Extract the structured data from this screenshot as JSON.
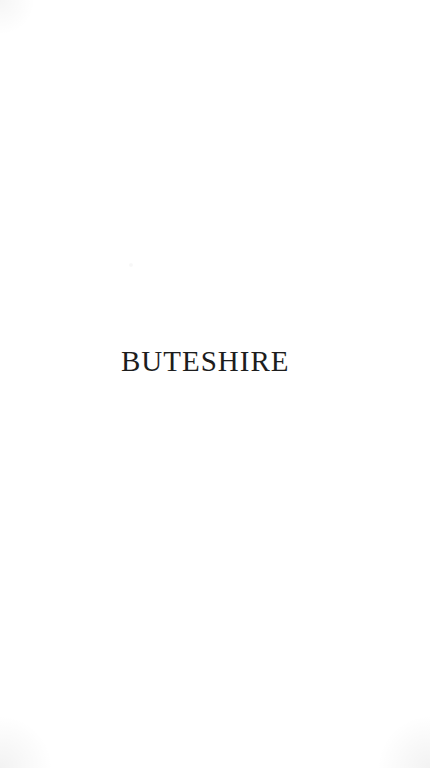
{
  "page": {
    "half_title": "BUTESHIRE"
  },
  "colors": {
    "paper": "#ffffff",
    "ink": "#1d1d1d"
  }
}
